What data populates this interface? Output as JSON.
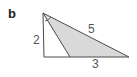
{
  "panel": {
    "label": "b"
  },
  "figure": {
    "type": "triangle-diagram",
    "labels": {
      "left_side": "2",
      "hypotenuse": "5",
      "base_segment": "3"
    },
    "colors": {
      "stroke": "#4a4a4a",
      "shaded_fill": "#d9d9d9"
    }
  }
}
